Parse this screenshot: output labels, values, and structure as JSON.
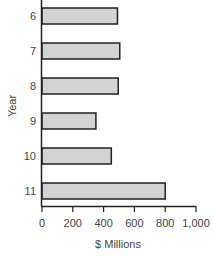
{
  "chart_data": {
    "type": "bar",
    "orientation": "horizontal",
    "title": "",
    "xlabel": "$ Millions",
    "ylabel": "Year",
    "categories": [
      "6",
      "7",
      "8",
      "9",
      "10",
      "11"
    ],
    "values": [
      490,
      505,
      495,
      350,
      450,
      800
    ],
    "xlim": [
      0,
      1000
    ],
    "xticks": [
      0,
      200,
      400,
      600,
      800,
      1000
    ],
    "xtick_labels": [
      "0",
      "200",
      "400",
      "600",
      "800",
      "1,000"
    ],
    "grid": false,
    "legend": null,
    "bar_fill": "#d3d3d3",
    "bar_stroke": "#222222"
  }
}
